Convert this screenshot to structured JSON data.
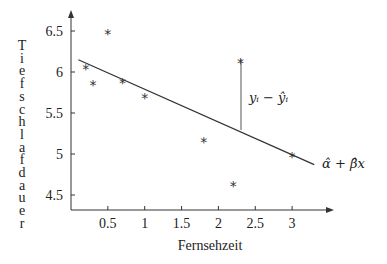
{
  "chart_data": {
    "type": "scatter",
    "title": "",
    "xlabel": "Fernsehzeit",
    "ylabel": "Tiefschlafdauer",
    "x_ticks": [
      "0.5",
      "1",
      "1.5",
      "2",
      "2.5",
      "3"
    ],
    "y_ticks": [
      "4.5",
      "5",
      "5.5",
      "6",
      "6.5"
    ],
    "xlim": [
      0,
      3.6
    ],
    "ylim": [
      4.3,
      6.7
    ],
    "grid": false,
    "series": [
      {
        "name": "Beobachtungen",
        "marker": "*",
        "points": [
          {
            "x": 0.2,
            "y": 6.07
          },
          {
            "x": 0.3,
            "y": 5.88
          },
          {
            "x": 0.5,
            "y": 6.5
          },
          {
            "x": 0.7,
            "y": 5.9
          },
          {
            "x": 1.0,
            "y": 5.72
          },
          {
            "x": 1.8,
            "y": 5.18
          },
          {
            "x": 2.2,
            "y": 4.65
          },
          {
            "x": 2.3,
            "y": 6.15
          },
          {
            "x": 3.0,
            "y": 5.0
          }
        ]
      },
      {
        "name": "Regressionsgerade",
        "type": "line",
        "points": [
          {
            "x": 0.1,
            "y": 6.15
          },
          {
            "x": 3.3,
            "y": 4.87
          }
        ]
      }
    ],
    "annotations": [
      {
        "text": "y_i − ŷ_i",
        "x": 2.3,
        "from_y": 6.15,
        "to_y": 5.28
      },
      {
        "text": "α̂ + β̂x",
        "position": "line end"
      }
    ]
  },
  "labels": {
    "xlabel": "Fernsehzeit",
    "ylabel_letters": [
      "T",
      "i",
      "e",
      "f",
      "s",
      "c",
      "h",
      "l",
      "a",
      "f",
      "d",
      "a",
      "u",
      "e",
      "r"
    ],
    "residual": "yᵢ − ŷᵢ",
    "line": "α̂ + β̂x",
    "marker": "*"
  }
}
